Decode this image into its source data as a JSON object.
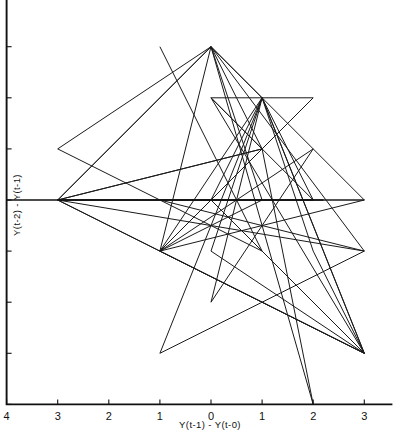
{
  "chart_data": {
    "type": "line",
    "title": "",
    "subtitle": "",
    "xlabel": "Y(t-1) - Y(t-0)",
    "ylabel": "Y(t-2) - Y(t-1)",
    "xlim": [
      -4,
      4
    ],
    "ylim": [
      -4,
      4
    ],
    "grid": false,
    "legend": null,
    "legend_position": "none",
    "xticks": [
      -4,
      -3,
      -2,
      -1,
      0,
      1,
      2,
      3
    ],
    "yticks": [
      -4,
      -3,
      -2,
      -1,
      0,
      1,
      2,
      3,
      4
    ],
    "xticklabels": [
      "4",
      "3",
      "2",
      "1",
      "0",
      "1",
      "2",
      "3"
    ],
    "yticklabels": [
      "4",
      "3",
      "2",
      "1",
      "0",
      "1",
      "2",
      "3",
      "4"
    ],
    "tick_label_note": "axis tick labels are printed as unsigned magnitudes",
    "marker": "none",
    "linewidth": 1,
    "color": "#000000",
    "series": [
      {
        "name": "trajectory",
        "points": [
          [
            -1,
            3
          ],
          [
            1,
            -1
          ],
          [
            -3,
            1
          ],
          [
            0,
            3
          ],
          [
            1,
            2
          ],
          [
            3,
            -3
          ],
          [
            -3,
            0
          ],
          [
            2,
            0
          ],
          [
            0,
            2
          ],
          [
            1,
            1
          ],
          [
            -1,
            -1
          ],
          [
            3,
            0
          ],
          [
            0,
            0
          ],
          [
            1,
            2
          ],
          [
            -1,
            -3
          ],
          [
            3,
            -1
          ],
          [
            -3,
            0
          ],
          [
            0,
            3
          ],
          [
            2,
            -4
          ],
          [
            1,
            1
          ],
          [
            -1,
            -1
          ],
          [
            2,
            1
          ],
          [
            0,
            -2
          ],
          [
            1,
            2
          ],
          [
            3,
            -3
          ],
          [
            -3,
            0
          ],
          [
            0,
            3
          ],
          [
            1,
            0
          ],
          [
            -1,
            -1
          ],
          [
            3,
            -3
          ],
          [
            0,
            2
          ],
          [
            2,
            2
          ],
          [
            1,
            1
          ],
          [
            -3,
            0
          ],
          [
            3,
            0
          ],
          [
            0,
            3
          ],
          [
            -1,
            -1
          ],
          [
            1,
            2
          ],
          [
            2,
            -1
          ],
          [
            3,
            -3
          ],
          [
            0,
            0
          ],
          [
            -3,
            0
          ],
          [
            1,
            1
          ],
          [
            0,
            3
          ],
          [
            3,
            -1
          ],
          [
            -1,
            0
          ],
          [
            2,
            0
          ],
          [
            1,
            2
          ],
          [
            0,
            -1
          ],
          [
            3,
            -3
          ]
        ]
      }
    ]
  },
  "axes": {
    "left_spine_at_x": -4,
    "bottom_spine_at_y": -4,
    "zero_line_at_y": 0,
    "zero_line_x_end": 2.2
  }
}
